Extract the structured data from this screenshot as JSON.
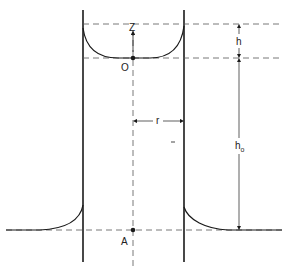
{
  "diagram": {
    "labels": {
      "z_axis": "Z",
      "origin": "O",
      "point_a": "A",
      "height_h": "h",
      "height_h0": "h",
      "height_h0_sub": "o",
      "radius": "r"
    },
    "colors": {
      "line": "#1a1a1a",
      "dashed": "#555555",
      "background": "#ffffff"
    }
  }
}
